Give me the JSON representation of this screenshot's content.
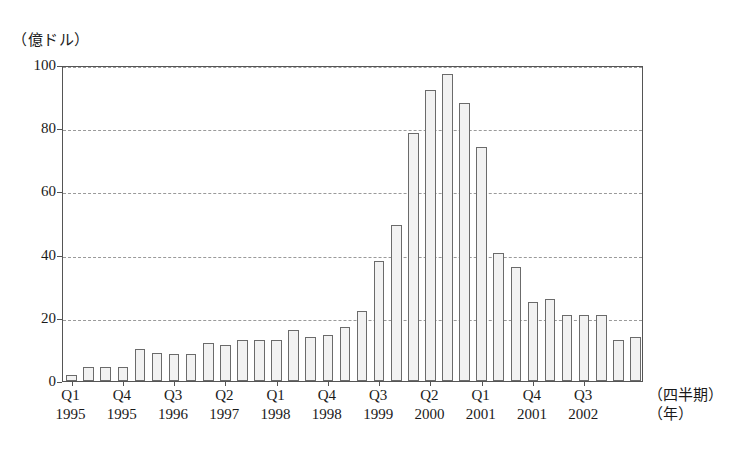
{
  "chart_data": {
    "type": "bar",
    "title": "",
    "ylabel": "（億ドル）",
    "xlabel_quarter": "（四半期）",
    "xlabel_year": "（年）",
    "ylim": [
      0,
      100
    ],
    "yticks": [
      0,
      20,
      40,
      60,
      80,
      100
    ],
    "grid": true,
    "legend": "none",
    "bar_fill": "#f2f2f2",
    "bar_stroke": "#6b6b6b",
    "axis_color": "#555555",
    "grid_color": "#9a9a9a",
    "categories": [
      "Q1 1995",
      "Q2 1995",
      "Q3 1995",
      "Q4 1995",
      "Q1 1996",
      "Q2 1996",
      "Q3 1996",
      "Q4 1996",
      "Q1 1997",
      "Q2 1997",
      "Q3 1997",
      "Q4 1997",
      "Q1 1998",
      "Q2 1998",
      "Q3 1998",
      "Q4 1998",
      "Q1 1999",
      "Q2 1999",
      "Q3 1999",
      "Q4 1999",
      "Q1 2000",
      "Q2 2000",
      "Q3 2000",
      "Q4 2000",
      "Q1 2001",
      "Q2 2001",
      "Q3 2001",
      "Q4 2001",
      "Q1 2002",
      "Q2 2002",
      "Q3 2002",
      "Q4 2002",
      "Q1 2003",
      "Q2 2003"
    ],
    "values": [
      2,
      4.5,
      4.5,
      4.5,
      10,
      9,
      8.5,
      8.5,
      12,
      11.5,
      13,
      13,
      13,
      16,
      14,
      14.5,
      17,
      22,
      38,
      49.5,
      78.5,
      92,
      97,
      88,
      74,
      40.5,
      36,
      25,
      26,
      21,
      21,
      21,
      13,
      14
    ],
    "xticklabels": [
      {
        "quarter": "Q1",
        "year": "1995",
        "index": 0
      },
      {
        "quarter": "Q4",
        "year": "1995",
        "index": 3
      },
      {
        "quarter": "Q3",
        "year": "1996",
        "index": 6
      },
      {
        "quarter": "Q2",
        "year": "1997",
        "index": 9
      },
      {
        "quarter": "Q1",
        "year": "1998",
        "index": 12
      },
      {
        "quarter": "Q4",
        "year": "1998",
        "index": 15
      },
      {
        "quarter": "Q3",
        "year": "1999",
        "index": 18
      },
      {
        "quarter": "Q2",
        "year": "2000",
        "index": 21
      },
      {
        "quarter": "Q1",
        "year": "2001",
        "index": 24
      },
      {
        "quarter": "Q4",
        "year": "2001",
        "index": 27
      },
      {
        "quarter": "Q3",
        "year": "2002",
        "index": 30
      }
    ]
  }
}
